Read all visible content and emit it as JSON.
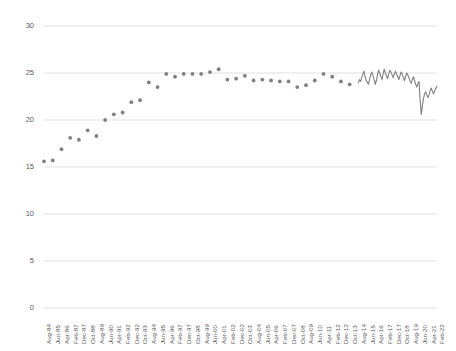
{
  "chart": {
    "type": "scatter-line",
    "title": "",
    "background_color": "#ffffff",
    "gridline_color": "#d9d9d9",
    "marker_color": "#808080",
    "line_color": "#808080",
    "axis_text_color": "#5a5a5a"
  },
  "chart_data": {
    "type": "scatter",
    "title": "",
    "subtitle": "",
    "xlabel": "",
    "ylabel": "",
    "ylim": [
      0,
      30
    ],
    "yticks": [
      0,
      5,
      10,
      15,
      20,
      25,
      30
    ],
    "ytick_labels": [
      "0",
      "5",
      "10",
      "15",
      "20",
      "25",
      "30"
    ],
    "grid": true,
    "legend": "none",
    "xtick_labels": [
      "Aug-84",
      "Jun-85",
      "Apr-86",
      "Feb-87",
      "Dec-87",
      "Oct-88",
      "Aug-89",
      "Jun-90",
      "Apr-91",
      "Feb-92",
      "Dec-92",
      "Oct-93",
      "Aug-94",
      "Jun-95",
      "Apr-96",
      "Feb-97",
      "Dec-97",
      "Oct-98",
      "Aug-99",
      "Jun-00",
      "Apr-01",
      "Feb-02",
      "Dec-02",
      "Oct-03",
      "Aug-04",
      "Jun-05",
      "Apr-06",
      "Feb-07",
      "Dec-07",
      "Oct-08",
      "Aug-09",
      "Jun-10",
      "Apr-11",
      "Feb-12",
      "Dec-12",
      "Oct-13",
      "Aug-14",
      "Jun-15",
      "Apr-16",
      "Feb-17",
      "Dec-17",
      "Oct-18",
      "Aug-19",
      "Jun-20",
      "Apr-21",
      "Feb-22"
    ],
    "xlim_labels": [
      "Aug-84",
      "Feb-22"
    ],
    "series": [
      {
        "name": "series-1",
        "marker": "circle",
        "values": [
          {
            "x": "Aug-84",
            "y": 15.6
          },
          {
            "x": "Jun-85",
            "y": 15.7
          },
          {
            "x": "Apr-86",
            "y": 16.9
          },
          {
            "x": "Feb-87",
            "y": 18.1
          },
          {
            "x": "Dec-87",
            "y": 17.9
          },
          {
            "x": "Oct-88",
            "y": 18.9
          },
          {
            "x": "Aug-89",
            "y": 18.3
          },
          {
            "x": "Jun-90",
            "y": 20.0
          },
          {
            "x": "Apr-91",
            "y": 20.6
          },
          {
            "x": "Feb-92",
            "y": 20.8
          },
          {
            "x": "Dec-92",
            "y": 21.9
          },
          {
            "x": "Oct-93",
            "y": 22.1
          },
          {
            "x": "Aug-94",
            "y": 24.0
          },
          {
            "x": "Jun-95",
            "y": 23.5
          },
          {
            "x": "Apr-96",
            "y": 24.9
          },
          {
            "x": "Feb-97",
            "y": 24.6
          },
          {
            "x": "Dec-97",
            "y": 24.9
          },
          {
            "x": "Oct-98",
            "y": 24.9
          },
          {
            "x": "Aug-99",
            "y": 24.9
          },
          {
            "x": "Jun-00",
            "y": 25.1
          },
          {
            "x": "Apr-01",
            "y": 25.4
          },
          {
            "x": "Feb-02",
            "y": 24.3
          },
          {
            "x": "Dec-02",
            "y": 24.4
          },
          {
            "x": "Oct-03",
            "y": 24.7
          },
          {
            "x": "Aug-04",
            "y": 24.2
          },
          {
            "x": "Jun-05",
            "y": 24.3
          },
          {
            "x": "Apr-06",
            "y": 24.2
          },
          {
            "x": "Feb-07",
            "y": 24.1
          },
          {
            "x": "Dec-07",
            "y": 24.1
          },
          {
            "x": "Oct-08",
            "y": 23.5
          },
          {
            "x": "Aug-09",
            "y": 23.7
          },
          {
            "x": "Jun-10",
            "y": 24.2
          },
          {
            "x": "Apr-11",
            "y": 24.9
          },
          {
            "x": "Feb-12",
            "y": 24.6
          },
          {
            "x": "Dec-12",
            "y": 24.1
          },
          {
            "x": "Oct-13",
            "y": 23.8
          },
          {
            "x": "Aug-14",
            "y": 25.2
          },
          {
            "x": "Jun-15",
            "y": 24.5
          },
          {
            "x": "Apr-16",
            "y": 25.3
          },
          {
            "x": "Feb-17",
            "y": 25.0
          },
          {
            "x": "Dec-17",
            "y": 24.8
          },
          {
            "x": "Oct-18",
            "y": 24.9
          },
          {
            "x": "Aug-19",
            "y": 24.2
          },
          {
            "x": "Jun-20",
            "y": 20.6
          },
          {
            "x": "Apr-21",
            "y": 22.8
          },
          {
            "x": "Feb-22",
            "y": 23.6
          }
        ]
      }
    ],
    "annotations": [
      {
        "text": "sharp decline to 20.6 around Jun-20",
        "x": "Jun-20",
        "y": 20.6
      }
    ],
    "dense_segment": {
      "note": "monthly observations drawn as a connected line from ~Aug-14 to Feb-22",
      "start_label": "Aug-14",
      "end_label": "Feb-22",
      "values": [
        24.0,
        24.3,
        24.1,
        24.5,
        24.9,
        25.2,
        24.6,
        24.2,
        24.0,
        23.8,
        24.4,
        24.8,
        25.1,
        24.7,
        24.3,
        23.8,
        24.2,
        24.8,
        25.3,
        25.0,
        24.6,
        24.3,
        24.9,
        25.4,
        25.0,
        24.7,
        24.4,
        24.9,
        25.3,
        25.1,
        24.8,
        24.5,
        24.9,
        25.2,
        24.9,
        24.6,
        24.3,
        24.7,
        25.1,
        24.9,
        24.5,
        24.2,
        24.6,
        25.0,
        24.8,
        24.5,
        24.1,
        23.9,
        24.3,
        24.6,
        24.2,
        23.8,
        23.5,
        23.9,
        24.1,
        22.0,
        20.6,
        21.5,
        22.3,
        22.8,
        23.0,
        22.6,
        22.4,
        22.7,
        23.2,
        23.4,
        23.0,
        22.8,
        23.1,
        23.4,
        23.6
      ]
    }
  }
}
